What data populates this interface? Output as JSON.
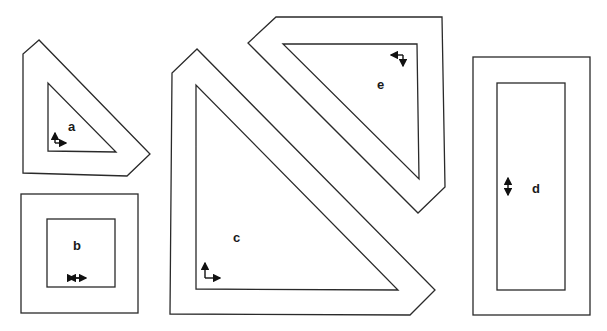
{
  "figure": {
    "panels": [
      {
        "id": "a",
        "label": "a",
        "shape": "triangular frame",
        "motion": "up-right corner arrows"
      },
      {
        "id": "b",
        "label": "b",
        "shape": "square frame",
        "motion": "horizontal double arrow"
      },
      {
        "id": "c",
        "label": "c",
        "shape": "large triangular frame",
        "motion": "up-right corner arrows"
      },
      {
        "id": "d",
        "label": "d",
        "shape": "tall rectangular frame",
        "motion": "vertical double arrow"
      },
      {
        "id": "e",
        "label": "e",
        "shape": "inverted triangular frame",
        "motion": "left-down corner arrows"
      }
    ],
    "stroke_color": "#2a2a2a",
    "background": "#ffffff"
  }
}
